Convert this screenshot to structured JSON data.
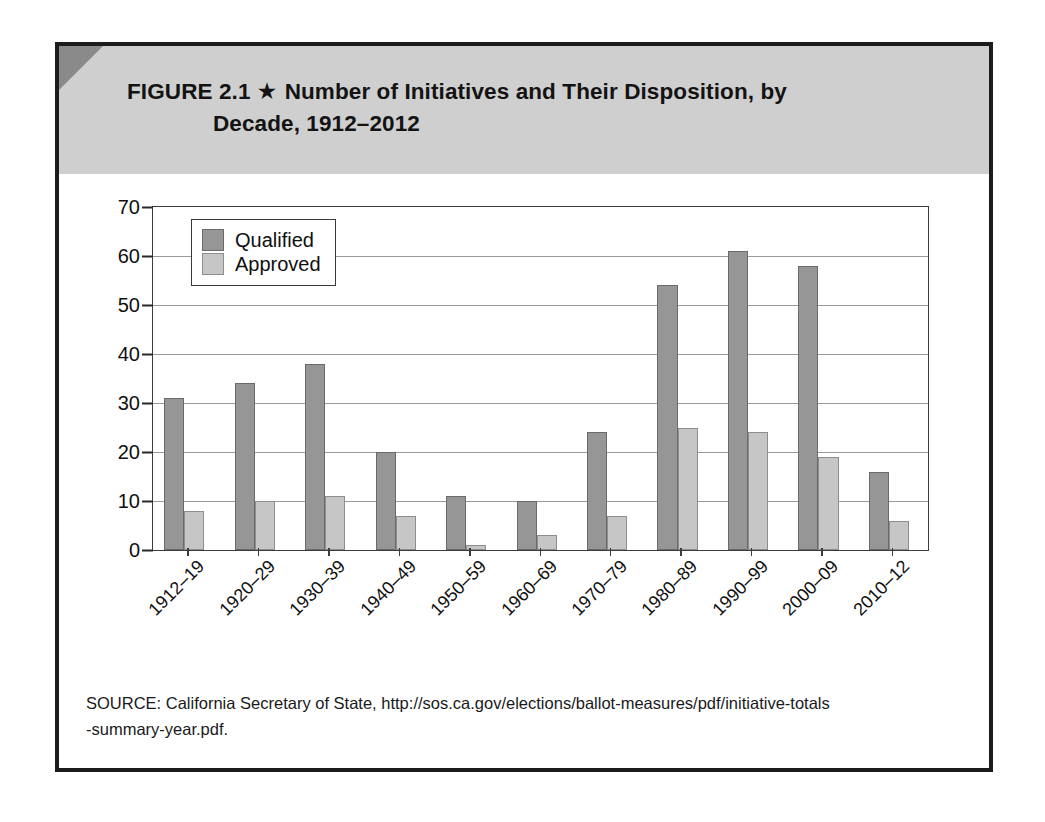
{
  "figure": {
    "number_label": "FIGURE 2.1",
    "star_glyph": "★",
    "title_line1": "Number of Initiatives and Their Disposition, by",
    "title_line2": "Decade, 1912–2012",
    "source_line1": "SOURCE: California Secretary of State, http://sos.ca.gov/elections/ballot-measures/pdf/initiative-totals",
    "source_line2": "-summary-year.pdf."
  },
  "colors": {
    "qualified": "#969696",
    "approved": "#c6c6c6",
    "header_band": "#cfcfcf",
    "corner_fold": "#8a8a8a",
    "frame": "#1c1c1c",
    "gridline": "#9a9a9a"
  },
  "chart_data": {
    "type": "bar",
    "title": "Number of Initiatives and Their Disposition, by Decade, 1912–2012",
    "xlabel": "",
    "ylabel": "",
    "ylim": [
      0,
      70
    ],
    "ytick_step": 10,
    "yticks": [
      "0",
      "10",
      "20",
      "30",
      "40",
      "50",
      "60",
      "70"
    ],
    "grid": true,
    "legend_position": "top-left-inside",
    "categories": [
      "1912–19",
      "1920–29",
      "1930–39",
      "1940–49",
      "1950–59",
      "1960–69",
      "1970–79",
      "1980–89",
      "1990–99",
      "2000–09",
      "2010–12"
    ],
    "series": [
      {
        "name": "Qualified",
        "color": "#969696",
        "values": [
          31,
          34,
          38,
          20,
          11,
          10,
          24,
          54,
          61,
          58,
          16
        ]
      },
      {
        "name": "Approved",
        "color": "#c6c6c6",
        "values": [
          8,
          10,
          11,
          7,
          1,
          3,
          7,
          25,
          24,
          19,
          6
        ]
      }
    ]
  }
}
